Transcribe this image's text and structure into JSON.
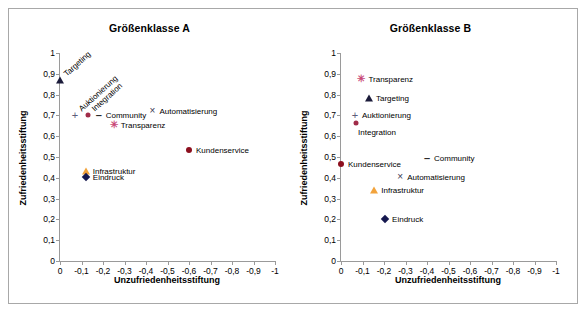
{
  "figure": {
    "width": 586,
    "height": 312,
    "background": "#ffffff",
    "frame_color": "#a8a8a8"
  },
  "axis": {
    "xlabel": "Unzufriedenheitsstiftung",
    "ylabel": "Zufriedenheitsstiftung",
    "xticks": [
      "0",
      "-0,1",
      "-0,2",
      "-0,3",
      "-0,4",
      "-0,5",
      "-0,6",
      "-0,7",
      "-0,8",
      "-0,9",
      "-1"
    ],
    "yticks": [
      "1",
      "0,9",
      "0,8",
      "0,7",
      "0,6",
      "0,5",
      "0,4",
      "0,3",
      "0,2",
      "0,1",
      "0"
    ]
  },
  "chart_data": [
    {
      "type": "scatter",
      "title": "Größenklasse A",
      "xlabel": "Unzufriedenheitsstiftung",
      "ylabel": "Zufriedenheitsstiftung",
      "xlim": [
        0,
        -1
      ],
      "ylim": [
        0,
        1
      ],
      "grid": false,
      "legend": "inline-point-labels",
      "points": [
        {
          "name": "Targeting",
          "x": 0.0,
          "y": 0.87,
          "marker": "triangle",
          "color": "#1b1b3a",
          "label_pos": "rotated-up-right"
        },
        {
          "name": "Auktionierung",
          "x": -0.07,
          "y": 0.7,
          "marker": "plus",
          "color": "#5c5c7a",
          "label_pos": "rotated-up-right"
        },
        {
          "name": "Integration",
          "x": -0.13,
          "y": 0.7,
          "marker": "circle-small",
          "color": "#a02c49",
          "label_pos": "rotated-up-right"
        },
        {
          "name": "Community",
          "x": -0.18,
          "y": 0.7,
          "marker": "dash",
          "color": "#2b2b2b",
          "label_pos": "right"
        },
        {
          "name": "Automatisierung",
          "x": -0.43,
          "y": 0.72,
          "marker": "cross",
          "color": "#3a3a55",
          "label_pos": "right"
        },
        {
          "name": "Transparenz",
          "x": -0.25,
          "y": 0.655,
          "marker": "star",
          "color": "#c94a78",
          "label_pos": "right"
        },
        {
          "name": "Kundenservice",
          "x": -0.6,
          "y": 0.535,
          "marker": "circle",
          "color": "#8c0f1e",
          "label_pos": "right"
        },
        {
          "name": "Infrastruktur",
          "x": -0.12,
          "y": 0.435,
          "marker": "triangle-orange",
          "color": "#f2a33c",
          "label_pos": "right"
        },
        {
          "name": "Eindruck",
          "x": -0.12,
          "y": 0.405,
          "marker": "diamond",
          "color": "#15184f",
          "label_pos": "right"
        }
      ]
    },
    {
      "type": "scatter",
      "title": "Größenklasse B",
      "xlabel": "Unzufriedenheitsstiftung",
      "ylabel": "Zufriedenheitsstiftung",
      "xlim": [
        0,
        -1
      ],
      "ylim": [
        0,
        1
      ],
      "grid": false,
      "legend": "inline-point-labels",
      "points": [
        {
          "name": "Transparenz",
          "x": -0.095,
          "y": 0.875,
          "marker": "star",
          "color": "#c94a78",
          "label_pos": "right"
        },
        {
          "name": "Targeting",
          "x": -0.13,
          "y": 0.785,
          "marker": "triangle",
          "color": "#1b1b3a",
          "label_pos": "right"
        },
        {
          "name": "Auktionierung",
          "x": -0.065,
          "y": 0.7,
          "marker": "plus",
          "color": "#5c5c7a",
          "label_pos": "right"
        },
        {
          "name": "Integration",
          "x": -0.07,
          "y": 0.665,
          "marker": "circle-small",
          "color": "#a02c49",
          "label_pos": "below-right"
        },
        {
          "name": "Community",
          "x": -0.4,
          "y": 0.495,
          "marker": "dash",
          "color": "#2b2b2b",
          "label_pos": "right"
        },
        {
          "name": "Kundenservice",
          "x": 0.0,
          "y": 0.465,
          "marker": "circle",
          "color": "#8c0f1e",
          "label_pos": "right"
        },
        {
          "name": "Automatisierung",
          "x": -0.275,
          "y": 0.405,
          "marker": "cross",
          "color": "#3a3a55",
          "label_pos": "right"
        },
        {
          "name": "Infrastruktur",
          "x": -0.155,
          "y": 0.34,
          "marker": "triangle-orange",
          "color": "#f2a33c",
          "label_pos": "right"
        },
        {
          "name": "Eindruck",
          "x": -0.205,
          "y": 0.2,
          "marker": "diamond",
          "color": "#15184f",
          "label_pos": "right"
        }
      ]
    }
  ]
}
